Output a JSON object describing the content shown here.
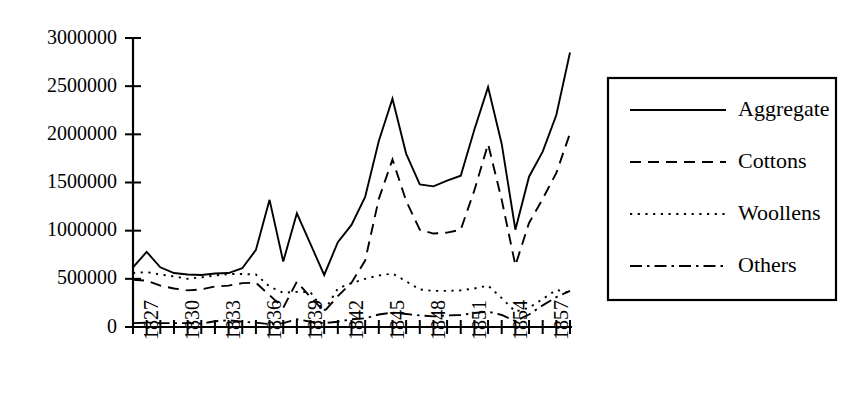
{
  "chart_data": {
    "type": "line",
    "title": "",
    "xlabel": "",
    "ylabel": "",
    "xlim": [
      1826,
      1858
    ],
    "ylim": [
      0,
      3000000
    ],
    "grid": false,
    "legend_position": "right-outside",
    "y_ticks": [
      0,
      500000,
      1000000,
      1500000,
      2000000,
      2500000,
      3000000
    ],
    "y_tick_labels": [
      "0",
      "500000",
      "1000000",
      "1500000",
      "2000000",
      "2500000",
      "3000000"
    ],
    "x_ticks": [
      1826,
      1827,
      1828,
      1829,
      1830,
      1831,
      1832,
      1833,
      1834,
      1835,
      1836,
      1837,
      1838,
      1839,
      1840,
      1841,
      1842,
      1843,
      1844,
      1845,
      1846,
      1847,
      1848,
      1849,
      1850,
      1851,
      1852,
      1853,
      1854,
      1855,
      1856,
      1857,
      1858
    ],
    "x_tick_labels": [
      "1827",
      "1830",
      "1833",
      "1836",
      "1839",
      "1842",
      "1845",
      "1848",
      "1851",
      "1854",
      "1857"
    ],
    "x_tick_label_years": [
      1827,
      1830,
      1833,
      1836,
      1839,
      1842,
      1845,
      1848,
      1851,
      1854,
      1857
    ],
    "x_tick_label_rotation": -90,
    "x": [
      1826,
      1827,
      1828,
      1829,
      1830,
      1831,
      1832,
      1833,
      1834,
      1835,
      1836,
      1837,
      1838,
      1839,
      1840,
      1841,
      1842,
      1843,
      1844,
      1845,
      1846,
      1847,
      1848,
      1849,
      1850,
      1851,
      1852,
      1853,
      1854,
      1855,
      1856,
      1857,
      1858
    ],
    "series": [
      {
        "name": "Aggregate",
        "style": "solid",
        "values": [
          620000,
          780000,
          620000,
          560000,
          545000,
          540000,
          555000,
          560000,
          610000,
          800000,
          1320000,
          680000,
          1180000,
          860000,
          540000,
          880000,
          1060000,
          1350000,
          1930000,
          2370000,
          1800000,
          1480000,
          1460000,
          1520000,
          1570000,
          2050000,
          2490000,
          1900000,
          1010000,
          1560000,
          1820000,
          2200000,
          2850000
        ]
      },
      {
        "name": "Cottons",
        "style": "dashed",
        "values": [
          490000,
          480000,
          430000,
          400000,
          380000,
          390000,
          420000,
          430000,
          455000,
          460000,
          330000,
          200000,
          470000,
          310000,
          160000,
          320000,
          460000,
          690000,
          1330000,
          1740000,
          1310000,
          1010000,
          970000,
          980000,
          1010000,
          1420000,
          1900000,
          1320000,
          640000,
          1080000,
          1330000,
          1600000,
          2010000
        ]
      },
      {
        "name": "Woollens",
        "style": "dotted",
        "values": [
          560000,
          570000,
          545000,
          525000,
          500000,
          515000,
          535000,
          550000,
          550000,
          545000,
          420000,
          355000,
          365000,
          360000,
          165000,
          400000,
          455000,
          500000,
          535000,
          555000,
          475000,
          390000,
          375000,
          375000,
          380000,
          400000,
          430000,
          300000,
          160000,
          200000,
          290000,
          385000,
          355000
        ]
      },
      {
        "name": "Others",
        "style": "dashdot",
        "values": [
          40000,
          45000,
          40000,
          40000,
          40000,
          35000,
          60000,
          70000,
          55000,
          45000,
          30000,
          40000,
          80000,
          55000,
          40000,
          55000,
          80000,
          90000,
          130000,
          150000,
          135000,
          120000,
          110000,
          120000,
          125000,
          145000,
          160000,
          125000,
          60000,
          130000,
          225000,
          310000,
          375000
        ]
      }
    ]
  },
  "legend": {
    "entries": [
      {
        "label": "Aggregate",
        "style": "solid"
      },
      {
        "label": "Cottons",
        "style": "dashed"
      },
      {
        "label": "Woollens",
        "style": "dotted"
      },
      {
        "label": "Others",
        "style": "dashdot"
      }
    ]
  },
  "colors": {
    "ink": "#000000",
    "background": "#ffffff"
  }
}
